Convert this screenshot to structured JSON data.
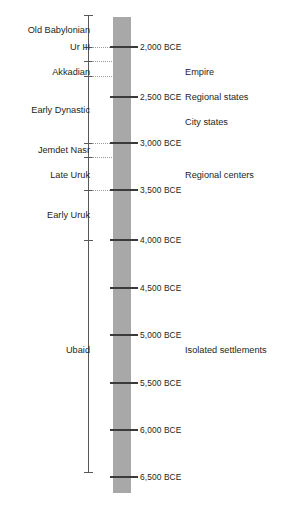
{
  "figure": {
    "colors": {
      "bar": "#a8a8a8",
      "axis": "#58585a",
      "tick": "#3a3a3c",
      "text": "#231f20",
      "leader": "#9a9a9a",
      "background": "#ffffff"
    }
  },
  "chart_data": {
    "type": "table",
    "title": "",
    "xlabel": "",
    "ylabel": "",
    "axis_orientation": "vertical",
    "axis_direction": "older downward",
    "scale_ticks": [
      {
        "label": "2,000 BCE",
        "value": 2000,
        "y": 47
      },
      {
        "label": "2,500 BCE",
        "value": 2500,
        "y": 97
      },
      {
        "label": "3,000 BCE",
        "value": 3000,
        "y": 143
      },
      {
        "label": "3,500 BCE",
        "value": 3500,
        "y": 190
      },
      {
        "label": "4,000 BCE",
        "value": 4000,
        "y": 240
      },
      {
        "label": "4,500 BCE",
        "value": 4500,
        "y": 288
      },
      {
        "label": "5,000 BCE",
        "value": 5000,
        "y": 335
      },
      {
        "label": "5,500 BCE",
        "value": 5500,
        "y": 383
      },
      {
        "label": "6,000 BCE",
        "value": 6000,
        "y": 430
      },
      {
        "label": "6,500 BCE",
        "value": 6500,
        "y": 477
      }
    ],
    "periods": [
      {
        "label": "Old Babylonian",
        "y": 30
      },
      {
        "label": "Ur III",
        "y": 47
      },
      {
        "label": "Akkadian",
        "y": 72
      },
      {
        "label": "Early Dynastic",
        "y": 110
      },
      {
        "label": "Jemdet Nasr",
        "y": 150
      },
      {
        "label": "Late Uruk",
        "y": 175
      },
      {
        "label": "Early Uruk",
        "y": 215
      },
      {
        "label": "Ubaid",
        "y": 350
      }
    ],
    "period_boundaries_y": [
      47,
      61,
      76,
      143,
      157,
      190,
      240
    ],
    "leader_lines_y": [
      47,
      61,
      76,
      143,
      157,
      190
    ],
    "axis_caps_y": [
      15,
      472
    ],
    "society_labels": [
      {
        "label": "Empire",
        "y": 72
      },
      {
        "label": "Regional states",
        "y": 97
      },
      {
        "label": "City states",
        "y": 122
      },
      {
        "label": "Regional centers",
        "y": 175
      },
      {
        "label": "Isolated settlements",
        "y": 350
      }
    ]
  }
}
